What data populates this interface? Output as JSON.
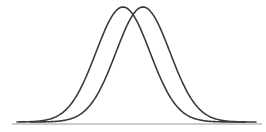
{
  "figure": {
    "width": 266,
    "height": 132,
    "background": "#ffffff",
    "baseline": {
      "x1": 12,
      "x2": 262,
      "y": 124,
      "color": "#bdbdbd",
      "width": 1.6
    },
    "curve_color": "#3a3a3a",
    "curve_width": 1.6,
    "curves": [
      {
        "name": "left-bell-curve",
        "center_x": 123,
        "sigma": 27,
        "peak_y": 7,
        "base_y": 122,
        "x_start": 17,
        "x_end": 245
      },
      {
        "name": "right-bell-curve",
        "center_x": 143,
        "sigma": 27,
        "peak_y": 7,
        "base_y": 122,
        "x_start": 30,
        "x_end": 256
      }
    ]
  }
}
